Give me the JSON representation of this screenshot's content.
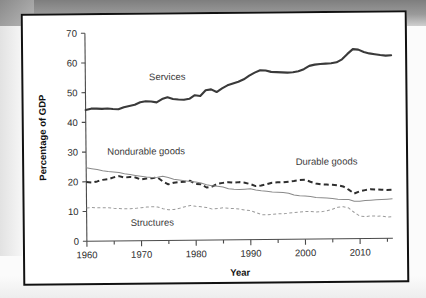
{
  "figure": {
    "background_color": "#ffffff",
    "frame_color": "#111111"
  },
  "chart_data": {
    "type": "line",
    "title": "",
    "xlabel": "Year",
    "ylabel": "Percentage of GDP",
    "xlim": [
      1960,
      2016
    ],
    "ylim": [
      0,
      70
    ],
    "yticks": [
      0,
      10,
      20,
      30,
      40,
      50,
      60,
      70
    ],
    "xticks": [
      1960,
      1970,
      1980,
      1990,
      2000,
      2010
    ],
    "xminor_step": 5,
    "grid": false,
    "legend_position": "inline-annotations",
    "annotations": [
      {
        "text": "Services",
        "x": 1975,
        "y": 54
      },
      {
        "text": "Nondurable goods",
        "x": 1971,
        "y": 29
      },
      {
        "text": "Durable goods",
        "x": 2004,
        "y": 25
      },
      {
        "text": "Structures",
        "x": 1972,
        "y": 5
      }
    ],
    "x": [
      1960,
      1961,
      1962,
      1963,
      1964,
      1965,
      1966,
      1967,
      1968,
      1969,
      1970,
      1971,
      1972,
      1973,
      1974,
      1975,
      1976,
      1977,
      1978,
      1979,
      1980,
      1981,
      1982,
      1983,
      1984,
      1985,
      1986,
      1987,
      1988,
      1989,
      1990,
      1991,
      1992,
      1993,
      1994,
      1995,
      1996,
      1997,
      1998,
      1999,
      2000,
      2001,
      2002,
      2003,
      2004,
      2005,
      2006,
      2007,
      2008,
      2009,
      2010,
      2011,
      2012,
      2013,
      2014,
      2015,
      2016
    ],
    "series": [
      {
        "name": "Services",
        "style": "solid-thick",
        "color": "#3a3a3a",
        "values": [
          44.2,
          44.6,
          44.6,
          44.5,
          44.6,
          44.4,
          44.3,
          45.0,
          45.4,
          45.8,
          46.6,
          46.9,
          46.8,
          46.5,
          47.6,
          48.2,
          47.6,
          47.4,
          47.3,
          47.6,
          48.8,
          48.5,
          50.4,
          50.7,
          49.8,
          51.0,
          52.0,
          52.6,
          53.2,
          54.0,
          55.2,
          56.2,
          57.0,
          56.9,
          56.4,
          56.3,
          56.2,
          56.1,
          56.2,
          56.5,
          57.2,
          58.3,
          58.7,
          58.9,
          59.0,
          59.1,
          59.4,
          60.4,
          62.2,
          63.8,
          63.6,
          62.8,
          62.3,
          62.0,
          61.7,
          61.5,
          61.6
        ]
      },
      {
        "name": "Durable goods",
        "style": "dashed-thick",
        "color": "#2e2e2e",
        "values": [
          19.9,
          19.7,
          20.1,
          20.6,
          20.8,
          21.4,
          21.8,
          21.3,
          21.5,
          21.3,
          20.6,
          20.9,
          21.0,
          21.3,
          19.9,
          18.9,
          19.4,
          19.6,
          19.7,
          20.0,
          18.9,
          18.8,
          17.7,
          18.0,
          18.9,
          19.2,
          19.4,
          19.2,
          19.4,
          19.2,
          18.7,
          18.0,
          18.2,
          18.6,
          19.1,
          19.2,
          19.2,
          19.4,
          19.6,
          19.9,
          20.0,
          19.3,
          18.7,
          18.4,
          18.3,
          18.2,
          18.0,
          17.6,
          16.5,
          15.2,
          15.9,
          16.3,
          16.6,
          16.5,
          16.4,
          16.3,
          16.4
        ]
      },
      {
        "name": "Nondurable goods",
        "style": "solid-thin",
        "color": "#8a8a8a",
        "values": [
          24.7,
          24.4,
          24.1,
          23.7,
          23.4,
          23.2,
          23.0,
          22.6,
          22.3,
          22.0,
          21.7,
          21.4,
          21.2,
          21.3,
          21.6,
          21.2,
          20.6,
          20.3,
          20.0,
          19.8,
          19.6,
          19.2,
          18.6,
          18.3,
          18.1,
          17.8,
          17.2,
          17.0,
          16.9,
          17.0,
          17.1,
          16.7,
          16.4,
          16.2,
          16.0,
          15.9,
          15.8,
          15.5,
          14.9,
          14.6,
          14.5,
          14.3,
          14.0,
          13.9,
          13.8,
          13.6,
          13.3,
          13.2,
          13.2,
          12.6,
          12.6,
          12.8,
          12.9,
          13.0,
          13.1,
          13.2,
          13.3
        ]
      },
      {
        "name": "Structures",
        "style": "dashed-thin",
        "color": "#9a9a9a",
        "values": [
          11.2,
          11.3,
          11.2,
          11.2,
          11.2,
          11.0,
          10.9,
          10.8,
          10.8,
          10.9,
          11.1,
          11.3,
          11.4,
          11.3,
          10.7,
          10.3,
          10.4,
          10.8,
          11.3,
          11.7,
          11.4,
          11.2,
          11.0,
          10.4,
          10.6,
          10.8,
          10.6,
          10.5,
          10.3,
          10.0,
          9.8,
          9.1,
          8.4,
          8.3,
          8.5,
          8.6,
          8.6,
          8.8,
          9.0,
          9.1,
          9.3,
          9.3,
          9.1,
          9.2,
          9.5,
          10.0,
          10.6,
          10.8,
          10.3,
          8.8,
          7.6,
          7.4,
          7.6,
          7.5,
          7.5,
          7.2,
          7.3
        ]
      }
    ]
  }
}
